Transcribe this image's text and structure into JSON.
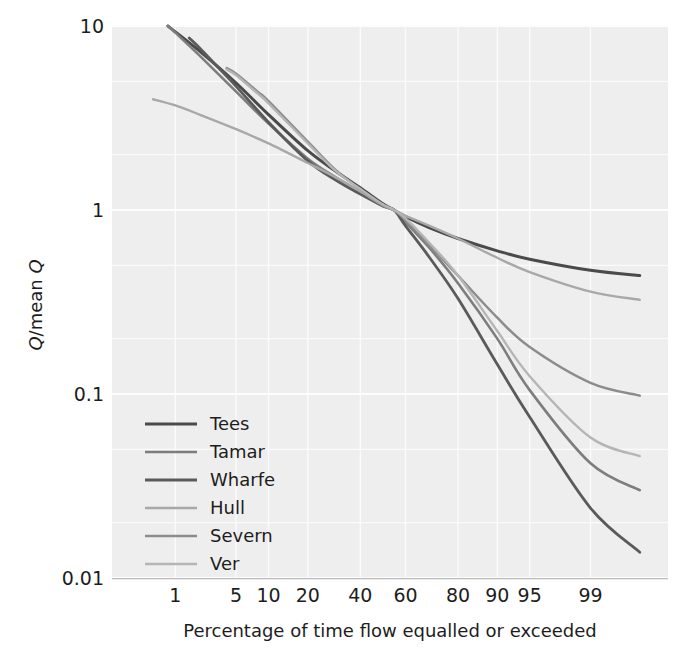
{
  "chart_data": {
    "type": "line",
    "title": "",
    "xlabel": "Percentage of time flow equalled or exceeded",
    "ylabel": "Q/mean Q",
    "ylabel_parts": {
      "num": "Q",
      "slash": "/",
      "den": "mean ",
      "den_italic": "Q"
    },
    "x_scale": "normal-probability",
    "y_scale": "log10",
    "xticks": [
      1,
      5,
      10,
      20,
      40,
      60,
      80,
      90,
      95,
      99
    ],
    "xtick_labels": [
      "1",
      "5",
      "10",
      "20",
      "40",
      "60",
      "80",
      "90",
      "95",
      "99"
    ],
    "xlim": [
      0.12,
      99.93
    ],
    "yticks": [
      10,
      1,
      0.1,
      0.01
    ],
    "ytick_labels": [
      "10",
      "1",
      "0.1",
      "0.01"
    ],
    "ylim": [
      0.01,
      10
    ],
    "grid": true,
    "legend_position": "lower-left",
    "series": [
      {
        "name": "Tees",
        "color": "#4a4a4a",
        "width": 3.0,
        "x": [
          0.8,
          1,
          2,
          5,
          10,
          20,
          30,
          40,
          50,
          55,
          60,
          70,
          80,
          90,
          95,
          99,
          99.8
        ],
        "y": [
          10.0,
          9.3,
          7.3,
          4.9,
          3.3,
          2.1,
          1.62,
          1.32,
          1.08,
          1.0,
          0.92,
          0.8,
          0.7,
          0.6,
          0.54,
          0.47,
          0.44
        ]
      },
      {
        "name": "Tamar",
        "color": "#7d7d7d",
        "width": 2.6,
        "x": [
          0.8,
          1,
          2,
          5,
          10,
          20,
          30,
          40,
          50,
          55,
          60,
          70,
          80,
          90,
          95,
          99,
          99.8
        ],
        "y": [
          10.0,
          9.2,
          6.9,
          4.4,
          2.95,
          1.9,
          1.5,
          1.25,
          1.05,
          1.0,
          0.86,
          0.62,
          0.4,
          0.2,
          0.105,
          0.042,
          0.03
        ]
      },
      {
        "name": "Wharfe",
        "color": "#5a5a5a",
        "width": 2.8,
        "x": [
          1.5,
          2,
          3,
          5,
          10,
          20,
          30,
          40,
          50,
          55,
          60,
          70,
          80,
          90,
          95,
          99,
          99.8
        ],
        "y": [
          8.6,
          7.6,
          6.2,
          4.7,
          3.0,
          1.85,
          1.45,
          1.22,
          1.05,
          1.0,
          0.82,
          0.55,
          0.33,
          0.145,
          0.075,
          0.024,
          0.0138
        ]
      },
      {
        "name": "Hull",
        "color": "#a8a8a8",
        "width": 2.4,
        "x": [
          0.5,
          1,
          2,
          5,
          10,
          20,
          30,
          40,
          50,
          55,
          60,
          70,
          80,
          90,
          95,
          99,
          99.8
        ],
        "y": [
          4.0,
          3.7,
          3.3,
          2.75,
          2.3,
          1.8,
          1.5,
          1.26,
          1.06,
          1.0,
          0.93,
          0.82,
          0.7,
          0.55,
          0.46,
          0.36,
          0.325
        ]
      },
      {
        "name": "Severn",
        "color": "#8c8c8c",
        "width": 2.5,
        "x": [
          4,
          5,
          8,
          10,
          20,
          30,
          40,
          50,
          55,
          60,
          70,
          80,
          90,
          95,
          99,
          99.8
        ],
        "y": [
          5.9,
          5.5,
          4.4,
          3.9,
          2.35,
          1.64,
          1.3,
          1.07,
          1.0,
          0.88,
          0.64,
          0.44,
          0.26,
          0.18,
          0.115,
          0.098
        ]
      },
      {
        "name": "Ver",
        "color": "#b5b5b5",
        "width": 2.4,
        "x": [
          4,
          5,
          8,
          10,
          20,
          30,
          40,
          50,
          55,
          60,
          70,
          80,
          90,
          95,
          99,
          99.8
        ],
        "y": [
          5.8,
          5.4,
          4.3,
          3.8,
          2.3,
          1.62,
          1.3,
          1.07,
          1.0,
          0.9,
          0.66,
          0.44,
          0.22,
          0.125,
          0.058,
          0.046
        ]
      }
    ]
  },
  "legend": {
    "items": [
      {
        "label": "Tees"
      },
      {
        "label": "Tamar"
      },
      {
        "label": "Wharfe"
      },
      {
        "label": "Hull"
      },
      {
        "label": "Severn"
      },
      {
        "label": "Ver"
      }
    ]
  },
  "colors": {
    "plot_background": "#eeeeee",
    "page_background": "#ffffff",
    "grid": "#fbfbfb",
    "text": "#1d1d1d"
  }
}
